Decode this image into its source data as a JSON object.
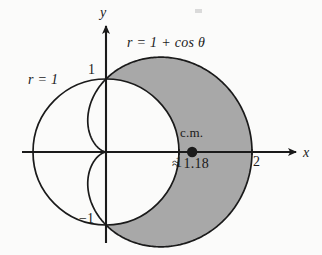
{
  "figure": {
    "kind": "polar-plot",
    "background_color": "#fbfbfa",
    "ink_color": "#1a1a1a",
    "shade_color": "#a8a8a8",
    "labels": {
      "cardioid_curve": "r = 1 + cos θ",
      "circle_curve": "r = 1",
      "axis_x": "x",
      "axis_y": "y",
      "tick_y_positive_1": "1",
      "tick_y_negative_1": "−1",
      "tick_x_1": "1",
      "tick_x_2": "2",
      "center_of_mass": "c.m.",
      "center_of_mass_value": "≈ 1.18"
    }
  },
  "chart_data": {
    "type": "line",
    "title": "",
    "subtitle": "",
    "xlabel": "x",
    "ylabel": "y",
    "grid": false,
    "legend_position": "inline-annotations",
    "coordinate_system": "polar",
    "xlim": [
      -1.45,
      2.6
    ],
    "ylim": [
      -1.55,
      1.6
    ],
    "origin_px": [
      106,
      152
    ],
    "unit_px": 73,
    "series": [
      {
        "name": "r = 1 + cos θ",
        "equation": "r = 1 + cos(theta)",
        "kind": "cardioid",
        "stroke": "#1a1a1a",
        "annotation": "r = 1 + cos θ",
        "key_points": [
          {
            "theta_deg": 0,
            "r": 2,
            "x": 2,
            "y": 0
          },
          {
            "theta_deg": 60,
            "r": 1.5,
            "x": 0.75,
            "y": 1.299
          },
          {
            "theta_deg": 90,
            "r": 1,
            "x": 0,
            "y": 1
          },
          {
            "theta_deg": 120,
            "r": 0.5,
            "x": -0.25,
            "y": 0.433
          },
          {
            "theta_deg": 180,
            "r": 0,
            "x": 0,
            "y": 0
          },
          {
            "theta_deg": 270,
            "r": 1,
            "x": 0,
            "y": -1
          },
          {
            "theta_deg": 300,
            "r": 1.5,
            "x": 0.75,
            "y": -1.299
          }
        ]
      },
      {
        "name": "r = 1",
        "equation": "r = 1",
        "kind": "circle",
        "stroke": "#1a1a1a",
        "annotation": "r = 1",
        "center": [
          0,
          0
        ],
        "radius": 1
      }
    ],
    "shaded_region": {
      "description": "region inside the cardioid r = 1 + cos θ and outside the circle r = 1",
      "fill": "#a8a8a8",
      "theta_range_deg": [
        -90,
        90
      ]
    },
    "markers": [
      {
        "name": "center of mass",
        "label": "c.m.",
        "value_label": "≈ 1.18",
        "x": 1.18,
        "y": 0,
        "style": "filled-dot"
      }
    ],
    "xticks": [
      1,
      2
    ],
    "xtick_labels": [
      "1",
      "2"
    ],
    "yticks": [
      1,
      -1
    ],
    "ytick_labels": [
      "1",
      "−1"
    ]
  }
}
